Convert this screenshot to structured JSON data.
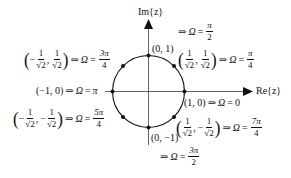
{
  "diagram": {
    "axes": {
      "x_label": "Re{z}",
      "y_label": "Im{z}",
      "color": "#111111"
    },
    "circle": {
      "cx": 148.5,
      "cy": 91.5,
      "r": 36,
      "color": "#111111"
    },
    "points": [
      {
        "id": "p0",
        "coord": "(1, 0)",
        "omega": "0"
      },
      {
        "id": "p45",
        "coord_x": "1",
        "coord_x_den": "√2",
        "coord_y": "1",
        "coord_y_den": "√2",
        "omega_num": "π",
        "omega_den": "4"
      },
      {
        "id": "p90",
        "coord": "(0, 1)",
        "omega_num": "π",
        "omega_den": "2"
      },
      {
        "id": "p135",
        "coord_x_sign": "−",
        "coord_x": "1",
        "coord_x_den": "√2",
        "coord_y": "1",
        "coord_y_den": "√2",
        "omega_num": "3π",
        "omega_den": "4"
      },
      {
        "id": "p180",
        "coord": "(−1, 0)",
        "omega": "π"
      },
      {
        "id": "p225",
        "coord_x_sign": "−",
        "coord_x": "1",
        "coord_x_den": "√2",
        "coord_y_sign": "−",
        "coord_y": "1",
        "coord_y_den": "√2",
        "omega_num": "5π",
        "omega_den": "4"
      },
      {
        "id": "p270",
        "coord": "(0, −1)",
        "omega_num": "3π",
        "omega_den": "2"
      },
      {
        "id": "p315",
        "coord_x": "1",
        "coord_x_den": "√2",
        "coord_y_sign": "−",
        "coord_y": "1",
        "coord_y_den": "√2",
        "omega_num": "7π",
        "omega_den": "4"
      }
    ],
    "symbols": {
      "implies": "⇒",
      "omega": "Ω",
      "equals": "=",
      "lparen": "(",
      "rparen": ")",
      "comma": ",",
      "sqrt": "√",
      "two": "2"
    }
  }
}
